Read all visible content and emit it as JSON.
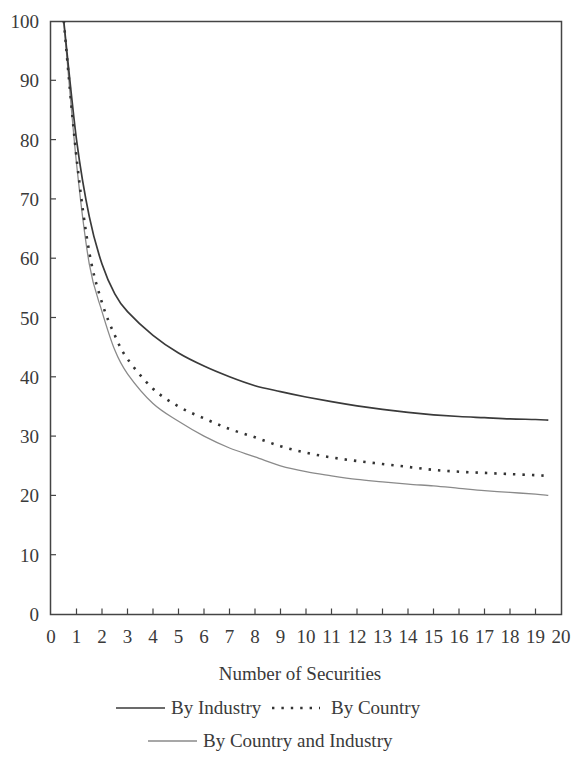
{
  "chart_data": {
    "type": "line",
    "title": "",
    "xlabel": "Number of Securities",
    "ylabel": "",
    "xlim": [
      0,
      20
    ],
    "ylim": [
      0,
      100
    ],
    "grid": false,
    "legend_position": "bottom",
    "x_ticks": [
      "0",
      "1",
      "2",
      "3",
      "4",
      "5",
      "6",
      "7",
      "8",
      "9",
      "10",
      "11",
      "12",
      "13",
      "14",
      "15",
      "16",
      "17",
      "18",
      "19",
      "20"
    ],
    "y_ticks": [
      "0",
      "10",
      "20",
      "30",
      "40",
      "50",
      "60",
      "70",
      "80",
      "90",
      "100"
    ],
    "x": [
      0.5,
      1,
      1.5,
      2,
      2.5,
      3,
      4,
      5,
      6,
      7,
      8,
      9,
      10,
      11,
      12,
      13,
      14,
      15,
      16,
      17,
      18,
      19,
      19.5
    ],
    "series": [
      {
        "name": "By Industry",
        "style": "solid",
        "color": "#3a3a3a",
        "values": [
          100,
          80,
          67,
          59,
          54,
          51,
          47,
          44,
          41.8,
          40,
          38.5,
          37.5,
          36.6,
          35.8,
          35.1,
          34.5,
          34,
          33.6,
          33.3,
          33.1,
          32.9,
          32.8,
          32.7
        ]
      },
      {
        "name": "By Country",
        "style": "dotted",
        "color": "#333333",
        "values": [
          100,
          77,
          61,
          52.5,
          47,
          43,
          38,
          35,
          33,
          31.2,
          29.8,
          28.3,
          27.2,
          26.4,
          25.8,
          25.3,
          24.8,
          24.3,
          24,
          23.8,
          23.6,
          23.4,
          23.3
        ]
      },
      {
        "name": "By Country and Industry",
        "style": "solid",
        "color": "#8a8a8a",
        "values": [
          100,
          76,
          59,
          51,
          44.5,
          40.5,
          35.5,
          32.5,
          30,
          28,
          26.5,
          25,
          24,
          23.3,
          22.7,
          22.3,
          21.9,
          21.6,
          21.2,
          20.8,
          20.5,
          20.2,
          20
        ]
      }
    ]
  },
  "legend": {
    "industry": "By Industry",
    "country": "By Country",
    "country_industry": "By Country and Industry"
  },
  "axis": {
    "x_title": "Number of Securities"
  }
}
